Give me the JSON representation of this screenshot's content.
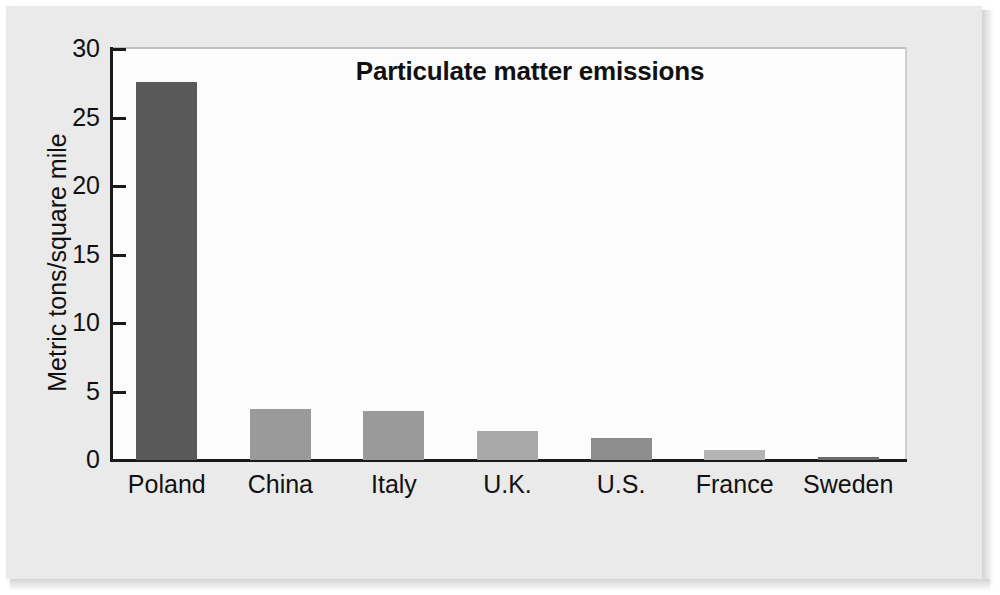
{
  "chart_data": {
    "type": "bar",
    "title": "Particulate matter emissions",
    "xlabel": "",
    "ylabel": "Metric tons/square mile",
    "categories": [
      "Poland",
      "China",
      "Italy",
      "U.K.",
      "U.S.",
      "France",
      "Sweden"
    ],
    "values": [
      27.6,
      3.7,
      3.6,
      2.1,
      1.6,
      0.7,
      0.2
    ],
    "ytick_labels": [
      "0",
      "5",
      "10",
      "15",
      "20",
      "25",
      "30"
    ],
    "ytick_values": [
      0,
      5,
      10,
      15,
      20,
      25,
      30
    ],
    "ylim": [
      0,
      30
    ],
    "grid": false,
    "legend": false,
    "bar_colors": [
      "#595959",
      "#9a9a9a",
      "#9a9a9a",
      "#a8a8a8",
      "#8d8d8d",
      "#b4b4b4",
      "#6b6b6b"
    ],
    "axis_color": "#1a1a1a",
    "plot_background": "#fcfcfc",
    "page_background": "#eaeaea"
  }
}
